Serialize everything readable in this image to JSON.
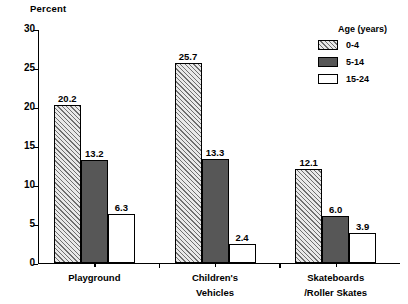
{
  "chart_data": {
    "type": "bar",
    "title": "",
    "ylabel": "Percent",
    "xlabel": "",
    "ylim": [
      0,
      30
    ],
    "yticks": [
      "0",
      "5",
      "10",
      "15",
      "20",
      "25",
      "30"
    ],
    "grid": false,
    "legend_position": "top-right",
    "legend_title": "Age  (years)",
    "categories": [
      "Playground",
      "Children's\nVehicles",
      "Skateboards\n/Roller Skates"
    ],
    "category_lines": [
      {
        "line1": "Playground",
        "line2": ""
      },
      {
        "line1": "Children's",
        "line2": "Vehicles"
      },
      {
        "line1": "Skateboards",
        "line2": "/Roller Skates"
      }
    ],
    "series": [
      {
        "name": "0-4",
        "pattern": "hatch",
        "values": [
          20.2,
          25.7,
          12.1
        ],
        "labels": [
          "20.2",
          "25.7",
          "12.1"
        ]
      },
      {
        "name": "5-14",
        "pattern": "solid",
        "values": [
          13.2,
          13.3,
          6.0
        ],
        "labels": [
          "13.2",
          "13.3",
          "6.0"
        ]
      },
      {
        "name": "15-24",
        "pattern": "open",
        "values": [
          6.3,
          2.4,
          3.9
        ],
        "labels": [
          "6.3",
          "2.4",
          "3.9"
        ]
      }
    ]
  },
  "legend": {
    "title": "Age  (years)",
    "items": [
      {
        "label": "0-4",
        "pattern": "hatch"
      },
      {
        "label": "5-14",
        "pattern": "solid"
      },
      {
        "label": "15-24",
        "pattern": "open"
      }
    ]
  },
  "colors": {
    "hatch_fill": "#e9e9e9",
    "hatch_line": "#6f6f6f",
    "solid_fill": "#575757",
    "open_fill": "#ffffff",
    "axis": "#000000",
    "text": "#000000"
  }
}
